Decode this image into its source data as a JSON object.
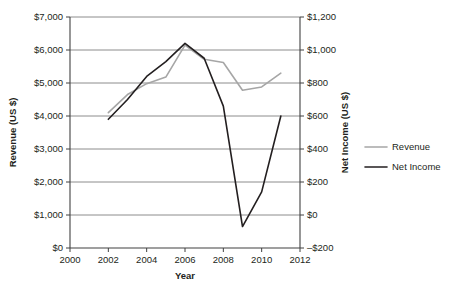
{
  "chart_data": {
    "type": "line",
    "title": "",
    "xlabel": "Year",
    "ylabel": "Revenue (US $)",
    "y2label": "Net Income (US $)",
    "x": [
      2002,
      2003,
      2004,
      2005,
      2006,
      2007,
      2008,
      2009,
      2010,
      2011
    ],
    "xlim": [
      2000,
      2012
    ],
    "ylim": [
      0,
      7000
    ],
    "y2lim": [
      -200,
      1200
    ],
    "grid": true,
    "legend_position": "right",
    "xticks": [
      2000,
      2002,
      2004,
      2006,
      2008,
      2010,
      2012
    ],
    "xtick_labels": [
      "2000",
      "2002",
      "2004",
      "2006",
      "2008",
      "2010",
      "2012"
    ],
    "yticks": [
      0,
      1000,
      2000,
      3000,
      4000,
      5000,
      6000,
      7000
    ],
    "ytick_labels": [
      "$0",
      "$1,000",
      "$2,000",
      "$3,000",
      "$4,000",
      "$5,000",
      "$6,000",
      "$7,000"
    ],
    "y2ticks": [
      -200,
      0,
      200,
      400,
      600,
      800,
      1000,
      1200
    ],
    "y2tick_labels": [
      "–$200",
      "$0",
      "$200",
      "$400",
      "$600",
      "$800",
      "$1,000",
      "$1,200"
    ],
    "series": [
      {
        "name": "Revenue",
        "axis": "left",
        "color": "#a6a6a6",
        "stroke_width": 1.6,
        "values": [
          4100,
          4650,
          4980,
          5180,
          6150,
          5720,
          5620,
          4780,
          4880,
          5300
        ]
      },
      {
        "name": "Net Income",
        "axis": "right",
        "color": "#231f20",
        "stroke_width": 1.6,
        "values": [
          580,
          700,
          840,
          930,
          1040,
          950,
          660,
          -70,
          140,
          600
        ]
      }
    ]
  },
  "legend": {
    "items": [
      {
        "label": "Revenue",
        "color": "#a6a6a6"
      },
      {
        "label": "Net Income",
        "color": "#231f20"
      }
    ]
  },
  "colors": {
    "background": "#ffffff",
    "text": "#231f20",
    "grid": "#808080",
    "axis": "#404040",
    "revenue": "#a6a6a6",
    "net_income": "#231f20"
  }
}
